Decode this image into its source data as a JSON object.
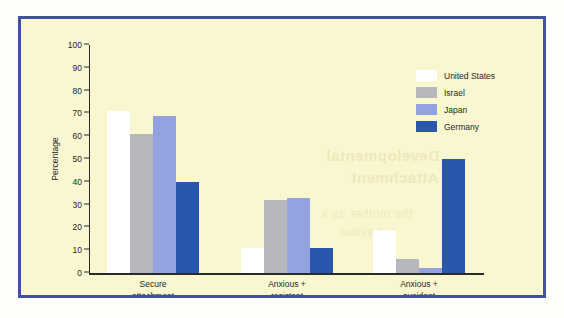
{
  "figure": {
    "background_color": "#f9f7d0",
    "border_color": "#41539f",
    "page_color": "#fdfdfa"
  },
  "bleed_through_text": {
    "line1": "Developmental",
    "line2": "in Attachment",
    "line3": "the mother as a",
    "line4": "behaviour"
  },
  "chart_data": {
    "type": "bar",
    "title": "",
    "subtitle": "",
    "xlabel": "",
    "ylabel": "Percentage",
    "ylim": [
      0,
      100
    ],
    "ytick_step": 10,
    "yticks": [
      0,
      10,
      20,
      30,
      40,
      50,
      60,
      70,
      80,
      90,
      100
    ],
    "ytick_labels": [
      "0",
      "10",
      "20",
      "30",
      "40",
      "50",
      "60",
      "70",
      "80",
      "90",
      "100"
    ],
    "grid": false,
    "legend_position": "top-right",
    "categories": [
      "Secure attachment",
      "Anxious + resistant",
      "Anxious + avoidant"
    ],
    "category_lines": [
      [
        "Secure",
        "attachment"
      ],
      [
        "Anxious +",
        "resistant"
      ],
      [
        "Anxious +",
        "avoidant"
      ]
    ],
    "series": [
      {
        "name": "United States",
        "color": "#ffffff",
        "values": [
          71,
          11,
          19
        ]
      },
      {
        "name": "Israel",
        "color": "#b6b8bd",
        "values": [
          61,
          32,
          6
        ]
      },
      {
        "name": "Japan",
        "color": "#94a3e0",
        "values": [
          69,
          33,
          2
        ]
      },
      {
        "name": "Germany",
        "color": "#2a56ad",
        "values": [
          40,
          11,
          50
        ]
      }
    ]
  }
}
